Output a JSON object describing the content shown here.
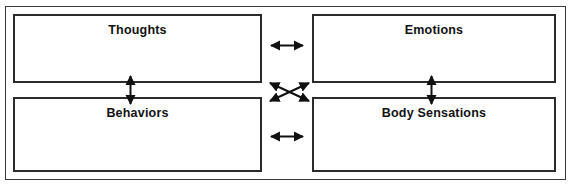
{
  "diagram": {
    "frame": {
      "name": "outer-frame"
    },
    "nodes": [
      {
        "id": "thoughts",
        "label": "Thoughts"
      },
      {
        "id": "emotions",
        "label": "Emotions"
      },
      {
        "id": "behaviors",
        "label": "Behaviors"
      },
      {
        "id": "body",
        "label": "Body Sensations"
      }
    ],
    "connectors": [
      {
        "id": "thoughts-emotions",
        "type": "double-arrow",
        "orientation": "horizontal",
        "from": "Thoughts",
        "to": "Emotions"
      },
      {
        "id": "behaviors-body",
        "type": "double-arrow",
        "orientation": "horizontal",
        "from": "Behaviors",
        "to": "Body Sensations"
      },
      {
        "id": "thoughts-behaviors",
        "type": "double-arrow",
        "orientation": "vertical",
        "from": "Thoughts",
        "to": "Behaviors"
      },
      {
        "id": "emotions-body",
        "type": "double-arrow",
        "orientation": "vertical",
        "from": "Emotions",
        "to": "Body Sensations"
      },
      {
        "id": "thoughts-body",
        "type": "double-arrow",
        "orientation": "diagonal-down-right",
        "from": "Thoughts",
        "to": "Body Sensations"
      },
      {
        "id": "emotions-behaviors",
        "type": "double-arrow",
        "orientation": "diagonal-down-left",
        "from": "Emotions",
        "to": "Behaviors"
      }
    ],
    "colors": {
      "background": "#ffffff",
      "box_border": "#2b2b2b",
      "frame_border": "#3a3a3a",
      "arrow": "#111111",
      "text": "#121212"
    }
  }
}
